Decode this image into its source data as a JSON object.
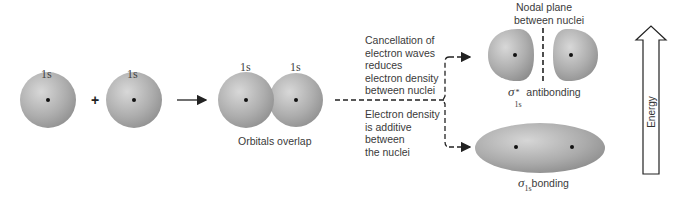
{
  "diagram": {
    "atomic_orbitals": [
      {
        "label": "1s"
      },
      {
        "label": "1s"
      }
    ],
    "plus_sign": "+",
    "overlap": {
      "labels": [
        "1s",
        "1s"
      ],
      "caption": "Orbitals overlap"
    },
    "branches": {
      "upper_text": [
        "Cancellation of",
        "electron waves",
        "reduces",
        "electron density",
        "between nuclei"
      ],
      "lower_text": [
        "Electron density",
        "is additive",
        "between",
        "the nuclei"
      ]
    },
    "antibonding": {
      "nodal_label": [
        "Nodal plane",
        "between nuclei"
      ],
      "symbol": "σ",
      "subscript": "1s",
      "superscript": "*",
      "caption": "antibonding"
    },
    "bonding": {
      "symbol": "σ",
      "subscript": "1s",
      "caption": "bonding"
    },
    "energy_label": "Energy",
    "colors": {
      "orbital_light": "#d4d4d4",
      "orbital_dark": "#8a8a8a",
      "line": "#222222"
    }
  }
}
